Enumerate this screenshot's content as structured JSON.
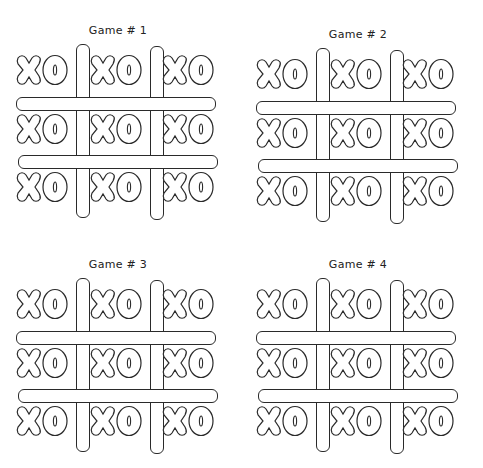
{
  "worksheet": {
    "games": [
      {
        "title": "Game # 1",
        "cells": [
          "XO",
          "XO",
          "XO",
          "XO",
          "XO",
          "XO",
          "XO",
          "XO",
          "XO"
        ]
      },
      {
        "title": "Game # 2",
        "cells": [
          "XO",
          "XO",
          "XO",
          "XO",
          "XO",
          "XO",
          "XO",
          "XO",
          "XO"
        ]
      },
      {
        "title": "Game # 3",
        "cells": [
          "XO",
          "XO",
          "XO",
          "XO",
          "XO",
          "XO",
          "XO",
          "XO",
          "XO"
        ]
      },
      {
        "title": "Game # 4",
        "cells": [
          "XO",
          "XO",
          "XO",
          "XO",
          "XO",
          "XO",
          "XO",
          "XO",
          "XO"
        ]
      }
    ],
    "colors": {
      "ink": "#2a2a2a",
      "paper": "#ffffff"
    }
  }
}
